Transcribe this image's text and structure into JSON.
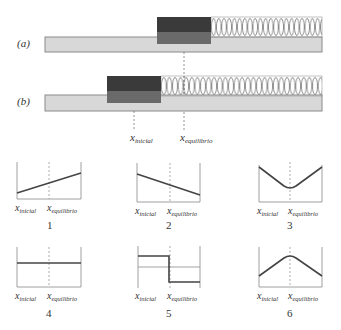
{
  "figure": {
    "panel_labels": {
      "a": "(a)",
      "b": "(b)"
    },
    "x_initial_label": {
      "base": "x",
      "sub": "inicial"
    },
    "x_equilibrium_label": {
      "base": "x",
      "sub": "equilibrio"
    },
    "colors": {
      "block_top": "#3a3a3a",
      "block_bottom": "#6a6a6a",
      "surface": "#d8d8d8",
      "surface_border": "#8a8a8a",
      "curve": "#444444",
      "axis": "#888888"
    }
  },
  "graphs": [
    {
      "number": "1",
      "shape": "increasing-linear"
    },
    {
      "number": "2",
      "shape": "decreasing-linear"
    },
    {
      "number": "3",
      "shape": "v-min-at-equilibrium"
    },
    {
      "number": "4",
      "shape": "constant"
    },
    {
      "number": "5",
      "shape": "step-down-at-equilibrium"
    },
    {
      "number": "6",
      "shape": "peak-at-equilibrium"
    }
  ]
}
